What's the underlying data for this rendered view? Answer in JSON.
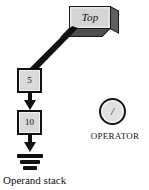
{
  "figure": {
    "caption": "Operand stack",
    "background_color": "#ffffff"
  },
  "top_pointer": {
    "label": "Top",
    "box_fill_color": "#d4d4d4",
    "box_border_color": "#171717",
    "box_shade_color": "#5f5f5f"
  },
  "stack": {
    "cells": [
      {
        "value": "5"
      },
      {
        "value": "10"
      }
    ],
    "cell_fill_color": "#d9d9d9",
    "cell_border_color": "#111111",
    "bottom_marker": "ground-bars",
    "bottom_bar_count": 3
  },
  "arrows": {
    "top_to_cell": "tapered-arrow",
    "cell_to_cell": "down-arrow",
    "cell_to_ground": "down-arrow",
    "color": "#111111"
  },
  "operator": {
    "symbol": "/",
    "label": "OPERATOR",
    "circle_fill_color": "#e0e0e0",
    "circle_border_color": "#141414"
  }
}
